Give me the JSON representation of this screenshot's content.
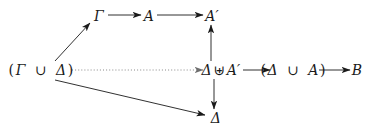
{
  "diagram": {
    "type": "commutative-diagram",
    "background_color": "#ffffff",
    "stroke_color": "#1a1a1a",
    "width": 375,
    "height": 134,
    "nodes": [
      {
        "id": "gamma-union-delta",
        "label": "(Γ ∪ Δ)",
        "x": 41,
        "y": 70
      },
      {
        "id": "gamma",
        "label": "Γ",
        "x": 99,
        "y": 16
      },
      {
        "id": "a",
        "label": "A",
        "x": 149,
        "y": 16
      },
      {
        "id": "a-prime-top",
        "label": "A′",
        "x": 212,
        "y": 16
      },
      {
        "id": "delta-uplus-aprime",
        "label": "Δ ⊎ A′",
        "x": 221,
        "y": 70
      },
      {
        "id": "delta-union-a",
        "label": "(Δ ∪ A)",
        "x": 293,
        "y": 70
      },
      {
        "id": "b",
        "label": "B",
        "x": 357,
        "y": 70
      },
      {
        "id": "delta-bottom",
        "label": "Δ",
        "x": 216,
        "y": 118
      }
    ],
    "edges": [
      {
        "id": "edge-union-to-gamma",
        "from": "gamma-union-delta",
        "to": "gamma",
        "style": "solid",
        "arrow": "forward"
      },
      {
        "id": "edge-gamma-to-a",
        "from": "gamma",
        "to": "a",
        "style": "solid",
        "arrow": "forward"
      },
      {
        "id": "edge-a-to-aprime",
        "from": "a",
        "to": "a-prime-top",
        "style": "solid",
        "arrow": "forward"
      },
      {
        "id": "edge-union-to-uplus-dotted",
        "from": "gamma-union-delta",
        "to": "delta-uplus-aprime",
        "style": "dotted",
        "arrow": "forward"
      },
      {
        "id": "edge-uplus-to-aprime-up",
        "from": "delta-uplus-aprime",
        "to": "a-prime-top",
        "style": "solid",
        "arrow": "forward"
      },
      {
        "id": "edge-uplus-to-delta-down",
        "from": "delta-uplus-aprime",
        "to": "delta-bottom",
        "style": "solid",
        "arrow": "forward"
      },
      {
        "id": "edge-uplus-to-delta-union-a",
        "from": "delta-uplus-aprime",
        "to": "delta-union-a",
        "style": "solid",
        "arrow": "forward"
      },
      {
        "id": "edge-delta-union-a-to-b",
        "from": "delta-union-a",
        "to": "b",
        "style": "solid",
        "arrow": "forward"
      },
      {
        "id": "edge-union-to-delta-bottom",
        "from": "gamma-union-delta",
        "to": "delta-bottom",
        "style": "solid",
        "arrow": "forward"
      }
    ]
  }
}
